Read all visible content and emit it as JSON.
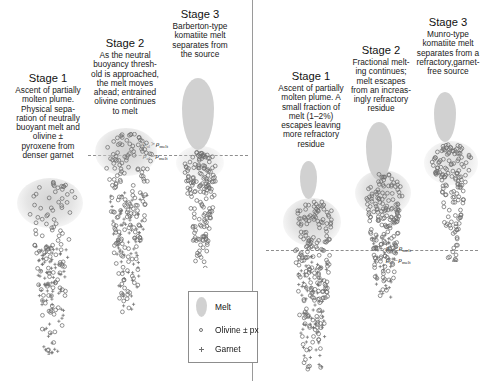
{
  "figure": {
    "divider_x": 252,
    "background": "#ffffff"
  },
  "colors": {
    "melt": "#c9c9c9",
    "olivine": "#6f6f6f",
    "garnet": "#6f6f6f",
    "dashed_line": "#8e8e8e",
    "divider": "#9a9a9a",
    "text": "#1a1a1a"
  },
  "left_panel": {
    "name": "Barberton-type komatiite pathway",
    "stages": [
      {
        "title": "Stage 1",
        "body": "Ascent of partially\nmolten plume.\nPhysical sepa-\nration of neutrally\nbuoyant melt and\nolivine ±\npyroxene from\ndenser garnet"
      },
      {
        "title": "Stage 2",
        "body": "As the neutral\nbuoyancy thresh-\nold is approached,\nthe melt moves\nahead; entrained\nolivine continues\nto melt"
      },
      {
        "title": "Stage 3",
        "body": "Barberton-type\nkomatiite melt\nseparates from\nthe source"
      }
    ],
    "density_note": {
      "above": "ρol > ρmelt",
      "below": "ρol – ρmelt",
      "above_symbol": "ρ",
      "above_sub": "ol",
      "above_rel": ">",
      "above_symbol2": "ρ",
      "above_sub2": "melt",
      "below_symbol": "ρ",
      "below_sub": "ol",
      "below_rel": "–",
      "below_symbol2": "ρ",
      "below_sub2": "melt"
    }
  },
  "right_panel": {
    "name": "Munro-type komatiite pathway",
    "stages": [
      {
        "title": "Stage 1",
        "body": "Ascent of partially\nmolten plume. A\nsmall fraction of\nmelt (1–2%)\nescapes leaving\nmore refractory\nresidue"
      },
      {
        "title": "Stage 2",
        "body": "Fractional melt-\ning continues;\nmelt escapes\nfrom an increas-\ningly refractory\nresidue"
      },
      {
        "title": "Stage 3",
        "body": "Munro-type\nkomatiite melt\nseparates from a\nrefractory,garnet-\nfree source"
      }
    ],
    "density_note": {
      "above_symbol": "ρ",
      "above_sub": "ol",
      "above_rel": ">",
      "above_symbol2": "ρ",
      "above_sub2": "melt",
      "below_symbol": "ρ",
      "below_sub": "ol",
      "below_rel": "–",
      "below_symbol2": "ρ",
      "below_sub2": "melt"
    }
  },
  "legend": {
    "items": [
      {
        "symbol": "melt-blob",
        "label": "Melt"
      },
      {
        "symbol": "open-circle",
        "label": "Olivine ± px"
      },
      {
        "symbol": "cross",
        "label": "Garnet"
      }
    ]
  },
  "plumes": {
    "left_stage1": {
      "head_cx": 48,
      "head_cy": 205,
      "circles": 95,
      "crosses": 70
    },
    "left_stage2": {
      "head_cx": 125,
      "head_cy": 170,
      "circles": 150,
      "crosses": 80
    },
    "left_stage3": {
      "head_cx": 199,
      "head_cy": 165,
      "circles": 150,
      "crosses": 0
    },
    "right_stage1": {
      "head_cx": 311,
      "head_cy": 215,
      "circles": 170,
      "crosses": 60
    },
    "right_stage2": {
      "head_cx": 381,
      "head_cy": 185,
      "circles": 150,
      "crosses": 40
    },
    "right_stage3": {
      "head_cx": 449,
      "head_cy": 150,
      "circles": 140,
      "crosses": 0
    }
  }
}
